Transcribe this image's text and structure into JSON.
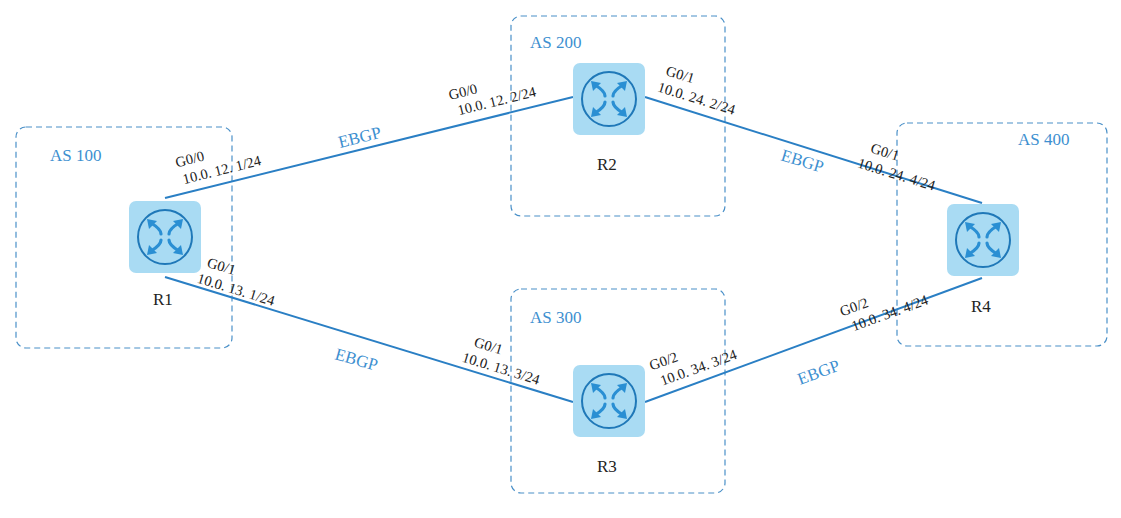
{
  "diagram": {
    "colors": {
      "accent": "#3d8fd0",
      "link": "#2a7fc4",
      "router_bg": "#a9dbf3",
      "router_ring": "#1f78b8",
      "text": "#222222"
    },
    "autonomous_systems": [
      {
        "id": "as100",
        "label": "AS 100"
      },
      {
        "id": "as200",
        "label": "AS 200"
      },
      {
        "id": "as300",
        "label": "AS 300"
      },
      {
        "id": "as400",
        "label": "AS 400"
      }
    ],
    "routers": [
      {
        "id": "r1",
        "label": "R1",
        "as": "AS 100",
        "icon": "router-icon"
      },
      {
        "id": "r2",
        "label": "R2",
        "as": "AS 200",
        "icon": "router-icon"
      },
      {
        "id": "r3",
        "label": "R3",
        "as": "AS 300",
        "icon": "router-icon"
      },
      {
        "id": "r4",
        "label": "R4",
        "as": "AS 400",
        "icon": "router-icon"
      }
    ],
    "links": [
      {
        "from": "R1",
        "to": "R2",
        "protocol": "EBGP",
        "a_if": "G0/0",
        "a_ip": "10.0. 12. 1/24",
        "b_if": "G0/0",
        "b_ip": "10.0. 12. 2/24"
      },
      {
        "from": "R1",
        "to": "R3",
        "protocol": "EBGP",
        "a_if": "G0/1",
        "a_ip": "10.0. 13. 1/24",
        "b_if": "G0/1",
        "b_ip": "10.0. 13. 3/24"
      },
      {
        "from": "R2",
        "to": "R4",
        "protocol": "EBGP",
        "a_if": "G0/1",
        "a_ip": "10.0. 24. 2/24",
        "b_if": "G0/1",
        "b_ip": "10.0. 24. 4/24"
      },
      {
        "from": "R3",
        "to": "R4",
        "protocol": "EBGP",
        "a_if": "G0/2",
        "a_ip": "10.0. 34. 3/24",
        "b_if": "G0/2",
        "b_ip": "10.0. 34. 4/24"
      }
    ]
  }
}
